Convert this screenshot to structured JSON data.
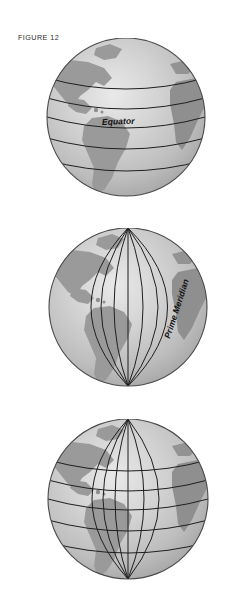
{
  "plate": {
    "figure_caption": "FIGURE 12",
    "background_color": "#ffffff"
  },
  "colors": {
    "ocean_light": "#d5d5d5",
    "ocean_mid": "#c2c2c2",
    "ocean_shadow": "#a6a6a6",
    "land": "#9a9a9a",
    "land_shadow": "#8a8a8a",
    "grid_line": "#1f1f1f",
    "outline": "#4a4a4a",
    "highlight": "#e6e6e6",
    "text": "#111111",
    "caption_text": "#2b2b2b"
  },
  "globes": [
    {
      "id": "globe-top",
      "name": "globe-latitude-lines",
      "grid": "latitude",
      "label": "Equator",
      "label_rotation_deg": -2.2,
      "center": {
        "x": 126,
        "y": 117
      },
      "radius": 79,
      "latitude_lines_deg": [
        60,
        30,
        0,
        -30,
        -60
      ],
      "longitude_lines_deg": [],
      "landmasses": [
        "North America",
        "South America",
        "Africa",
        "Greenland"
      ]
    },
    {
      "id": "globe-middle",
      "name": "globe-longitude-lines",
      "grid": "longitude",
      "label": "Prime Meridian",
      "label_rotation_deg": -72,
      "center": {
        "x": 128,
        "y": 307
      },
      "radius": 79,
      "latitude_lines_deg": [],
      "longitude_lines_deg": [
        -90,
        -60,
        -30,
        0,
        30,
        60
      ],
      "landmasses": [
        "North America",
        "South America",
        "Africa",
        "Greenland"
      ]
    },
    {
      "id": "globe-bottom",
      "name": "globe-full-grid",
      "grid": "graticule",
      "label": "",
      "label_rotation_deg": 0,
      "center": {
        "x": 128,
        "y": 499
      },
      "radius": 80,
      "latitude_lines_deg": [
        60,
        30,
        0,
        -30,
        -60
      ],
      "longitude_lines_deg": [
        -90,
        -60,
        -30,
        0,
        30,
        60
      ],
      "landmasses": [
        "North America",
        "South America",
        "Africa",
        "Greenland"
      ]
    }
  ]
}
